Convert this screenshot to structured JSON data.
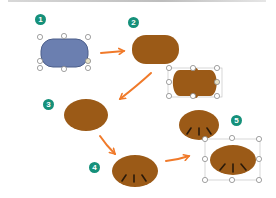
{
  "diagram": {
    "type": "step-sequence",
    "colors": {
      "shape_blue": "#6b7fb0",
      "shape_blue_stroke": "#4c5e8a",
      "shape_brown": "#9b5a17",
      "arrow": "#f07a2a",
      "badge": "#15907a",
      "handle_stroke": "#8a8a8a",
      "gill_lines": "#2a1a0a"
    },
    "steps": [
      {
        "number": "1",
        "shape": "rounded-rectangle",
        "fill": "blue",
        "selected": true
      },
      {
        "number": "2",
        "shape": "rounded-rectangle (pill)",
        "fill": "brown",
        "selected": false,
        "variant": "selected copy with handles"
      },
      {
        "number": "3",
        "shape": "ellipse",
        "fill": "brown",
        "selected": false
      },
      {
        "number": "4",
        "shape": "ellipse with gill lines",
        "fill": "brown",
        "selected": false
      },
      {
        "number": "5",
        "shape": "ellipse with gill lines",
        "fill": "brown",
        "selected": true
      }
    ],
    "connectors": [
      {
        "from": "1",
        "to": "2",
        "direction": "right"
      },
      {
        "from": "2",
        "to": "3",
        "direction": "down-left"
      },
      {
        "from": "3",
        "to": "4",
        "direction": "down-right"
      },
      {
        "from": "4",
        "to": "5",
        "direction": "right"
      }
    ]
  },
  "badges": {
    "b1": "1",
    "b2": "2",
    "b3": "3",
    "b4": "4",
    "b5": "5"
  }
}
